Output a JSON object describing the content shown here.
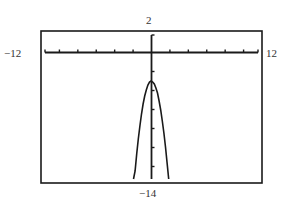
{
  "chart_data": {
    "type": "line",
    "title": "",
    "xlabel": "",
    "ylabel": "",
    "window": {
      "xmin": -12,
      "xmax": 12,
      "ymin": -14,
      "ymax": 2,
      "xscl": 2,
      "yscl": 2
    },
    "xlim": [
      -12,
      12
    ],
    "ylim": [
      -14,
      2
    ],
    "grid": false,
    "series": [
      {
        "name": "parabola",
        "equation": "y = -3x^2 - 3",
        "vertex": [
          0,
          -3
        ],
        "x": [
          -1.9,
          -1.6,
          -1.3,
          -1.0,
          -0.7,
          -0.4,
          0,
          0.4,
          0.7,
          1.0,
          1.3,
          1.6,
          1.9
        ],
        "values": [
          -13.8,
          -10.7,
          -8.1,
          -6.0,
          -4.5,
          -3.5,
          -3.0,
          -3.5,
          -4.5,
          -6.0,
          -8.1,
          -10.7,
          -13.8
        ]
      }
    ],
    "axis_labels": {
      "top": "2",
      "left": "−12",
      "right": "12",
      "bottom": "−14"
    }
  },
  "colors": {
    "frame": "#1a1a1a",
    "axis": "#1a1a1a",
    "curve": "#1a1a1a",
    "background": "#ffffff"
  }
}
